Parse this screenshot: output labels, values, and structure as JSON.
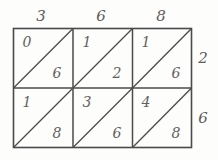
{
  "figure": {
    "kind": "lattice-multiplication-grid",
    "columns": 3,
    "rows": 2,
    "stroke_color": "#4a4a4a",
    "digit_color": "#616161",
    "background_color": "#fdfdfc"
  },
  "top_labels": [
    {
      "value": "3"
    },
    {
      "value": "6"
    },
    {
      "value": "8"
    }
  ],
  "right_labels": [
    {
      "value": "2"
    },
    {
      "value": "6"
    }
  ],
  "cells": [
    {
      "row": 0,
      "col": 0,
      "upper": "0",
      "lower": "6"
    },
    {
      "row": 0,
      "col": 1,
      "upper": "1",
      "lower": "2"
    },
    {
      "row": 0,
      "col": 2,
      "upper": "1",
      "lower": "6"
    },
    {
      "row": 1,
      "col": 0,
      "upper": "1",
      "lower": "8"
    },
    {
      "row": 1,
      "col": 1,
      "upper": "3",
      "lower": "6"
    },
    {
      "row": 1,
      "col": 2,
      "upper": "4",
      "lower": "8"
    }
  ]
}
